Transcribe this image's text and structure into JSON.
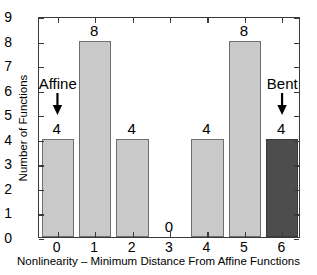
{
  "chart_data": {
    "type": "bar",
    "title": "",
    "subtitle": "",
    "xlabel": "Nonlinearity – Minimum Distance From Affine Functions",
    "ylabel": "Number of Functions",
    "categories": [
      "0",
      "1",
      "2",
      "3",
      "4",
      "5",
      "6"
    ],
    "values": [
      4,
      8,
      4,
      0,
      4,
      8,
      4
    ],
    "bar_labels": [
      "4",
      "8",
      "4",
      "0",
      "4",
      "8",
      "4"
    ],
    "xlim": [
      -0.5,
      6.5
    ],
    "ylim": [
      0,
      9
    ],
    "y_ticks": [
      "0",
      "1",
      "2",
      "3",
      "4",
      "5",
      "6",
      "7",
      "8",
      "9"
    ],
    "x_ticks": [
      "0",
      "1",
      "2",
      "3",
      "4",
      "5",
      "6"
    ],
    "grid": false,
    "legend": false,
    "legend_position": "none",
    "bar_colors": [
      "#c9c9c9",
      "#c9c9c9",
      "#c9c9c9",
      "#c9c9c9",
      "#c9c9c9",
      "#c9c9c9",
      "#4d4d4d"
    ],
    "highlight_color": "#4d4d4d",
    "default_bar_color": "#c9c9c9",
    "bar_edge_color": "#6f6f6f",
    "axis_color": "#3a3a3a",
    "background_color": "#ffffff",
    "annotations": [
      {
        "text": "Affine",
        "x": 0,
        "y": 6.0,
        "arrow": "down",
        "target_category": "0"
      },
      {
        "text": "Bent",
        "x": 6,
        "y": 6.0,
        "arrow": "down",
        "target_category": "6"
      }
    ]
  }
}
